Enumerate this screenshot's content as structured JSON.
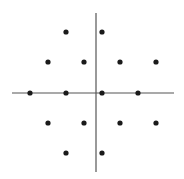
{
  "diagram": {
    "type": "point-constellation",
    "axes": {
      "color": "#555555",
      "horizontal": {
        "x1": 12,
        "x2": 174,
        "y": 93
      },
      "vertical": {
        "x": 96,
        "y1": 13,
        "y2": 172
      }
    },
    "point_color": "#1a1a1a",
    "point_radius": 2.6,
    "points": [
      {
        "x": 66,
        "y": 32
      },
      {
        "x": 102,
        "y": 32
      },
      {
        "x": 48,
        "y": 62
      },
      {
        "x": 84,
        "y": 62
      },
      {
        "x": 120,
        "y": 62
      },
      {
        "x": 156,
        "y": 62
      },
      {
        "x": 30,
        "y": 93
      },
      {
        "x": 66,
        "y": 93
      },
      {
        "x": 102,
        "y": 93
      },
      {
        "x": 138,
        "y": 93
      },
      {
        "x": 48,
        "y": 123
      },
      {
        "x": 84,
        "y": 123
      },
      {
        "x": 120,
        "y": 123
      },
      {
        "x": 156,
        "y": 123
      },
      {
        "x": 66,
        "y": 153
      },
      {
        "x": 102,
        "y": 153
      }
    ]
  }
}
